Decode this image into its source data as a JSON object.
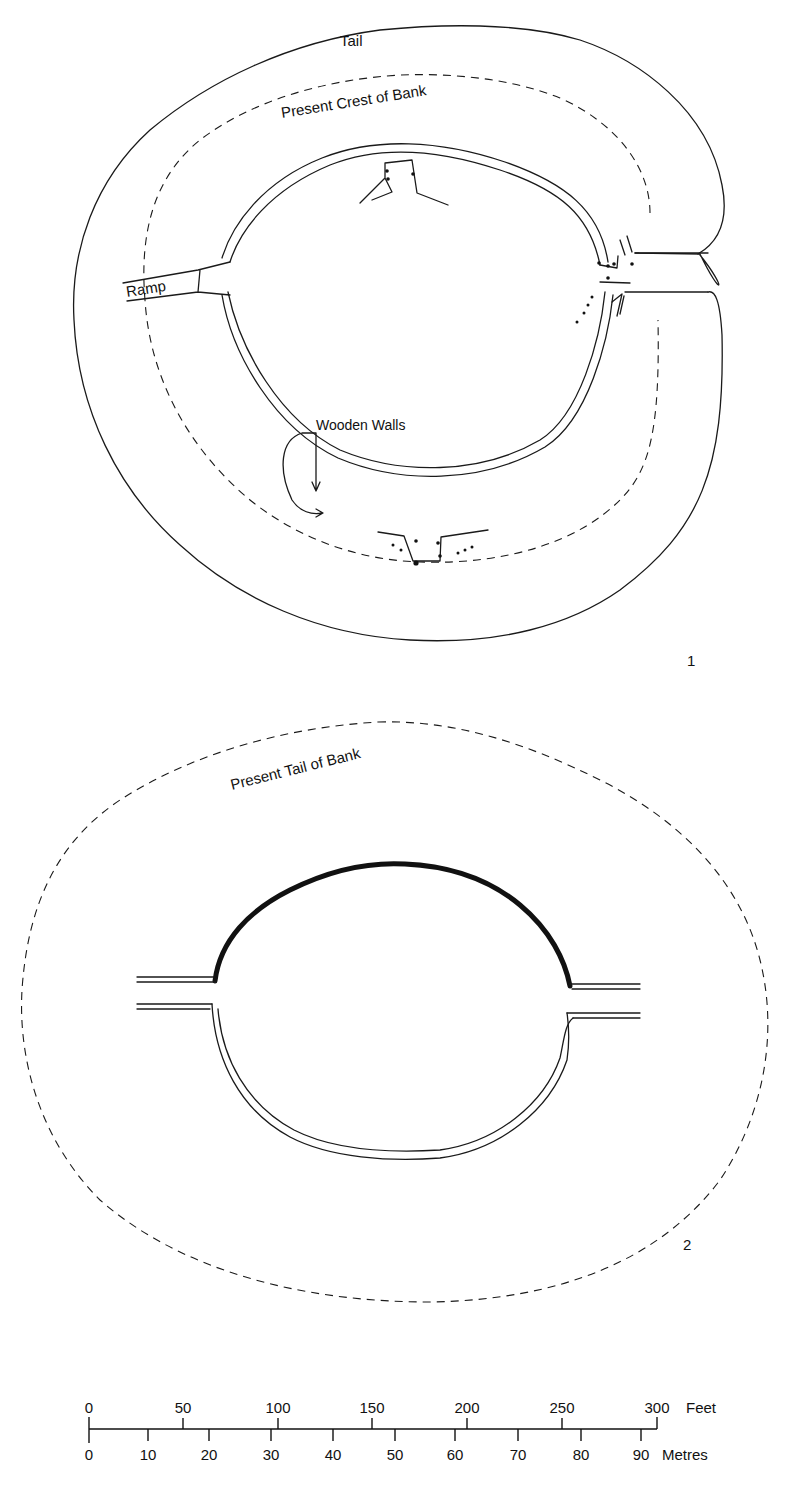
{
  "figure_1": {
    "number_label": "1",
    "labels": {
      "tail": "Tail",
      "crest": "Present Crest of Bank",
      "ramp": "Ramp",
      "wooden_walls": "Wooden Walls"
    }
  },
  "figure_2": {
    "number_label": "2",
    "labels": {
      "tail": "Present Tail of Bank"
    }
  },
  "scale_bar": {
    "feet": {
      "unit": "Feet",
      "ticks": [
        "0",
        "50",
        "100",
        "150",
        "200",
        "250",
        "300"
      ]
    },
    "metres": {
      "unit": "Metres",
      "ticks": [
        "0",
        "10",
        "20",
        "30",
        "40",
        "50",
        "60",
        "70",
        "80",
        "90"
      ]
    }
  }
}
